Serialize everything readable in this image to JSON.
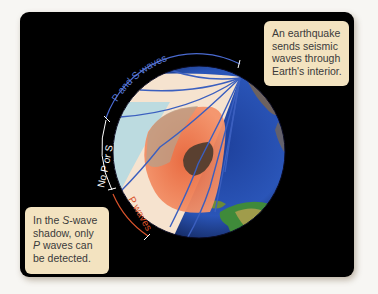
{
  "figure": {
    "type": "seismic wave propagation diagram",
    "colors": {
      "background": "#000000",
      "callout_fill": "#f3e3c0",
      "wave_lines": "#3b5fbf",
      "p_and_s_arc": "#4a6ad0",
      "no_p_or_s_arc": "#ffffff",
      "p_wave_arc": "#d9532b",
      "mantle": "#f6e3cf",
      "outer_core": "#ee7a4e",
      "inner_core": "#5a4030",
      "s_shadow_zone": "#bcdbe0",
      "ocean": "#2a55b8"
    }
  },
  "labels": {
    "p_and_s_waves": "P and S waves",
    "no_p_or_s": "No P or S",
    "p_waves": "P waves"
  },
  "callouts": {
    "epicenter": {
      "lines": [
        "An earthquake",
        "sends seismic",
        "waves through",
        "Earth's interior."
      ]
    },
    "shadow": {
      "line1_prefix": "In the ",
      "line1_italic": "S",
      "line1_suffix": "-wave",
      "line2": "shadow, only",
      "line3_italic": "P",
      "line3_suffix": " waves can",
      "line4": "be detected."
    }
  }
}
